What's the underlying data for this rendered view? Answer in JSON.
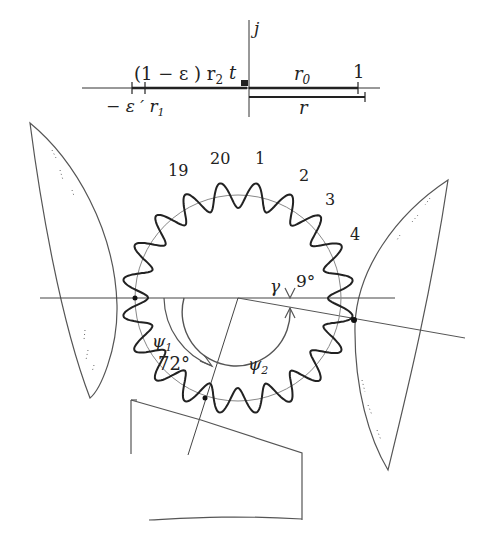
{
  "axis_diagram": {
    "j_label": "j",
    "upper_left_label": "(1 − ε ) r",
    "upper_left_sub": "2",
    "t_label": "t",
    "r0_label": "r",
    "r0_sub": "0",
    "one_label": "1",
    "lower_left_label": "− ε ′ r",
    "lower_left_sub": "1",
    "r_label": "r"
  },
  "gear": {
    "tooth_count": 20,
    "tooth_labels": [
      "19",
      "20",
      "1",
      "2",
      "3",
      "4"
    ]
  },
  "angles": {
    "gamma_label": "γ",
    "gamma_value": "9°",
    "psi1_label": "ψ",
    "psi1_sub": "1",
    "psi1_value": "72°",
    "psi2_label": "ψ",
    "psi2_sub": "2"
  },
  "colors": {
    "ink": "#222222",
    "light_ink": "#555555",
    "background": "#ffffff"
  }
}
